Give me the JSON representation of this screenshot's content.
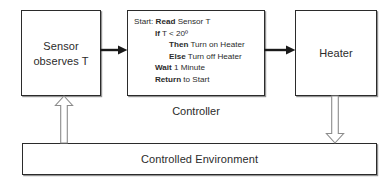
{
  "diagram": {
    "colors": {
      "background": "#ffffff",
      "stroke": "#2b2b2b",
      "hollow_arrow_stroke": "#8c8c8c",
      "text": "#2b2b2b"
    },
    "nodes": {
      "sensor": {
        "line1": "Sensor",
        "line2": "observes T"
      },
      "heater": {
        "label": "Heater"
      },
      "controller": {
        "caption": "Controller",
        "code_lines": [
          {
            "indent": 0,
            "segments": [
              {
                "text": "Start:",
                "bold": false
              },
              {
                "text": " Read",
                "bold": true
              },
              {
                "text": " Sensor T",
                "bold": false
              }
            ]
          },
          {
            "indent": 1,
            "segments": [
              {
                "text": "If",
                "bold": true
              },
              {
                "text": "  T < 20º",
                "bold": false
              }
            ]
          },
          {
            "indent": 2,
            "segments": [
              {
                "text": "Then",
                "bold": true
              },
              {
                "text": "  Turn on Heater",
                "bold": false
              }
            ]
          },
          {
            "indent": 2,
            "segments": [
              {
                "text": "Else",
                "bold": true
              },
              {
                "text": " Turn off Heater",
                "bold": false
              }
            ]
          },
          {
            "indent": 3,
            "segments": [
              {
                "text": "Wait",
                "bold": true
              },
              {
                "text": " 1 Minute",
                "bold": false
              }
            ]
          },
          {
            "indent": 3,
            "segments": [
              {
                "text": "Return",
                "bold": true
              },
              {
                "text": " to Start",
                "bold": false
              }
            ]
          }
        ]
      },
      "environment": {
        "label": "Controlled Environment"
      }
    },
    "arrows": {
      "sensor_to_controller": {
        "style": "solid",
        "direction": "right"
      },
      "controller_to_heater": {
        "style": "solid",
        "direction": "right"
      },
      "environment_to_sensor": {
        "style": "hollow",
        "direction": "up"
      },
      "heater_to_environment": {
        "style": "hollow",
        "direction": "down"
      }
    }
  }
}
